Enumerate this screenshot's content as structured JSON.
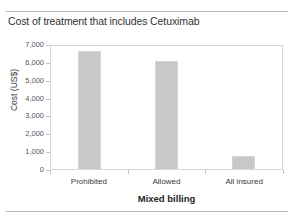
{
  "chart_data": {
    "type": "bar",
    "title": "Cost of treatment that includes Cetuximab",
    "xlabel": "Mixed billing",
    "ylabel": "Cost (US$)",
    "categories": [
      "Prohibited",
      "Allowed",
      "All insured"
    ],
    "values": [
      6630,
      6050,
      730
    ],
    "ylim": [
      0,
      7000
    ],
    "yticks": [
      0,
      1000,
      2000,
      3000,
      4000,
      5000,
      6000,
      7000
    ],
    "ytick_labels": [
      "0",
      "1,000",
      "2,000",
      "3,000",
      "4,000",
      "5,000",
      "6,000",
      "7,000"
    ],
    "grid": false,
    "legend": "none",
    "bar_color": "#c8c8c8",
    "bar_edge_color": "#d5d5d5",
    "frame_color": "#d8d8d8",
    "text_color": "#3a3a3a"
  }
}
